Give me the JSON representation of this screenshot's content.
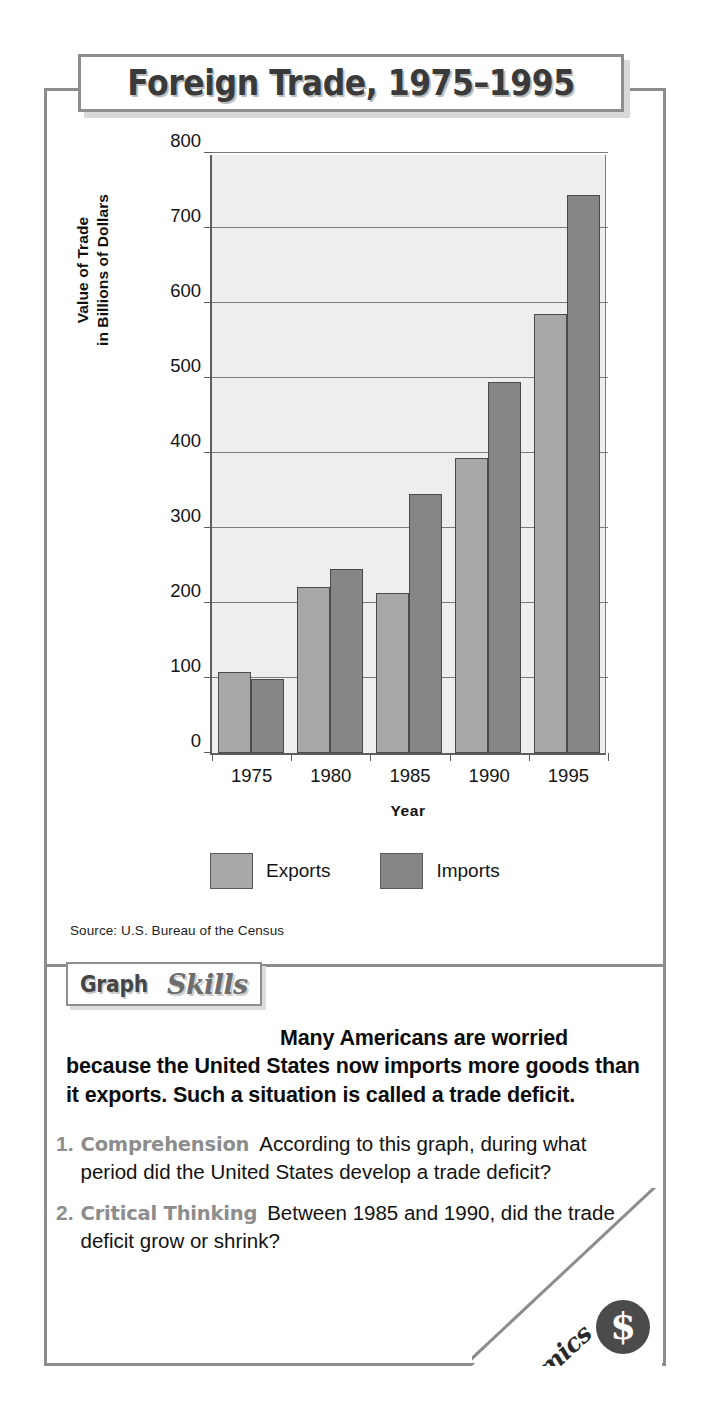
{
  "title": "Foreign Trade, 1975–1995",
  "chart_data": {
    "type": "bar",
    "title": "Foreign Trade, 1975–1995",
    "xlabel": "Year",
    "ylabel": "Value of Trade in Billions of Dollars",
    "ylabel_line1": "Value of Trade",
    "ylabel_line2": "in Billions of Dollars",
    "categories": [
      "1975",
      "1980",
      "1985",
      "1990",
      "1995"
    ],
    "series": [
      {
        "name": "Exports",
        "color": "#a8a8a8",
        "values": [
          108,
          221,
          214,
          394,
          585
        ]
      },
      {
        "name": "Imports",
        "color": "#868686",
        "values": [
          99,
          245,
          345,
          495,
          744
        ]
      }
    ],
    "ylim": [
      0,
      800
    ],
    "yticks": [
      0,
      100,
      200,
      300,
      400,
      500,
      600,
      700,
      800
    ],
    "ytick_labels": [
      "0",
      "100",
      "200",
      "300",
      "400",
      "500",
      "600",
      "700",
      "800"
    ],
    "grid": true,
    "legend_position": "bottom-center",
    "source": "Source:  U.S. Bureau of the Census"
  },
  "skills_badge": {
    "word_graph": "Graph",
    "word_skills": "Skills"
  },
  "intro": {
    "lead": "Many Americans",
    "rest": "are worried because the United States now imports more goods than it exports. Such a situation is called a trade deficit."
  },
  "questions": [
    {
      "number": "1.",
      "label": "Comprehension",
      "text": "According to this graph, during what period did the United States develop a trade deficit?"
    },
    {
      "number": "2.",
      "label": "Critical Thinking",
      "text": "Between 1985 and 1990, did the trade deficit grow or shrink?"
    }
  ],
  "corner_badge": {
    "word": "Economics",
    "symbol": "$",
    "icon": "dollar-sign-icon"
  }
}
